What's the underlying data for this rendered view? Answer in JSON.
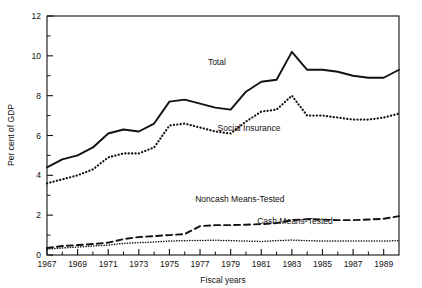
{
  "chart_data": {
    "type": "line",
    "title": "",
    "xlabel": "Fiscal years",
    "ylabel": "Per cent of GDP",
    "xlim": [
      1967,
      1990
    ],
    "ylim": [
      0,
      12
    ],
    "grid": false,
    "legend_position": "inline-annotations",
    "x_tick_labels": [
      "1967",
      "1969",
      "1971",
      "1973",
      "1975",
      "1977",
      "1979",
      "1981",
      "1983",
      "1985",
      "1987",
      "1989"
    ],
    "x_tick_values": [
      1967,
      1969,
      1971,
      1973,
      1975,
      1977,
      1979,
      1981,
      1983,
      1985,
      1987,
      1989
    ],
    "x_minor_ticks": [
      1968,
      1970,
      1972,
      1974,
      1976,
      1978,
      1980,
      1982,
      1984,
      1986,
      1988
    ],
    "y_tick_labels": [
      "0",
      "2",
      "4",
      "6",
      "8",
      "10",
      "12"
    ],
    "y_tick_values": [
      0,
      2,
      4,
      6,
      8,
      10,
      12
    ],
    "y_minor_ticks": [
      1,
      3,
      5,
      7,
      9,
      11
    ],
    "x": [
      1967,
      1968,
      1969,
      1970,
      1971,
      1972,
      1973,
      1974,
      1975,
      1976,
      1977,
      1978,
      1979,
      1980,
      1981,
      1982,
      1983,
      1984,
      1985,
      1986,
      1987,
      1988,
      1989,
      1990
    ],
    "series": [
      {
        "name": "Total",
        "style": "solid",
        "label_x": 1978.1,
        "label_y": 9.55,
        "values": [
          4.4,
          4.8,
          5.0,
          5.4,
          6.1,
          6.3,
          6.2,
          6.6,
          7.7,
          7.8,
          7.6,
          7.4,
          7.3,
          8.2,
          8.7,
          8.8,
          10.2,
          9.3,
          9.3,
          9.2,
          9.0,
          8.9,
          8.9,
          9.3
        ]
      },
      {
        "name": "Social Insurance",
        "style": "dotted",
        "label_x": 1980.2,
        "label_y": 6.25,
        "values": [
          3.6,
          3.8,
          4.0,
          4.3,
          4.9,
          5.1,
          5.1,
          5.4,
          6.5,
          6.6,
          6.4,
          6.2,
          6.1,
          6.7,
          7.2,
          7.3,
          8.0,
          7.0,
          7.0,
          6.9,
          6.8,
          6.8,
          6.9,
          7.1
        ]
      },
      {
        "name": "Noncash Means-Tested",
        "style": "dashed",
        "label_x": 1979.6,
        "label_y": 2.65,
        "values": [
          0.35,
          0.45,
          0.5,
          0.55,
          0.62,
          0.8,
          0.9,
          0.95,
          1.0,
          1.05,
          1.45,
          1.5,
          1.5,
          1.52,
          1.55,
          1.6,
          1.75,
          1.8,
          1.78,
          1.75,
          1.75,
          1.78,
          1.82,
          1.95
        ]
      },
      {
        "name": "Cash Means-Tested",
        "style": "dotted-fine",
        "label_x": 1983.2,
        "label_y": 1.55,
        "values": [
          0.3,
          0.35,
          0.4,
          0.45,
          0.5,
          0.58,
          0.62,
          0.65,
          0.7,
          0.72,
          0.73,
          0.74,
          0.72,
          0.7,
          0.68,
          0.72,
          0.75,
          0.72,
          0.7,
          0.7,
          0.7,
          0.7,
          0.7,
          0.72
        ]
      }
    ]
  },
  "axes": {
    "y_title": "Per cent of GDP",
    "x_title": "Fiscal years"
  }
}
